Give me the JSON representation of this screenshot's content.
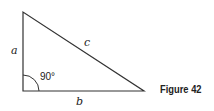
{
  "figure": {
    "caption": "Figure 42",
    "sides": {
      "a": "a",
      "b": "b",
      "c": "c"
    },
    "angle_label": "90°",
    "vertices": {
      "top": [
        23,
        12
      ],
      "right_angle": [
        23,
        91
      ],
      "right": [
        144,
        91
      ]
    },
    "stroke_color": "#333333"
  }
}
